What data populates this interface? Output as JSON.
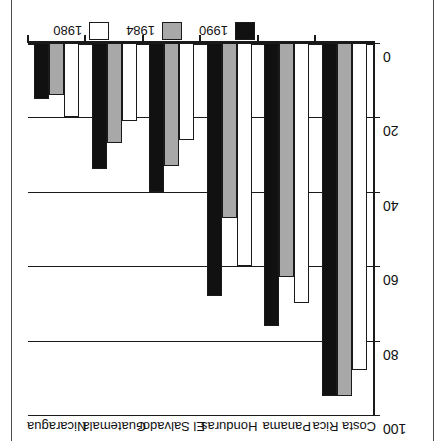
{
  "chart_data": {
    "type": "bar",
    "title": "",
    "subtitle": "",
    "xlabel": "",
    "ylabel": "",
    "ylim": [
      0,
      100
    ],
    "yticks": [
      0,
      20,
      40,
      60,
      80,
      100
    ],
    "ytick_labels": [
      "0",
      "20",
      "40",
      "60",
      "80",
      "100"
    ],
    "grid": true,
    "orientation": "vertical-inverted-180",
    "legend_position": "bottom-center",
    "categories": [
      "Costa Rica",
      "Panama",
      "Honduras",
      "El Salvador",
      "Guatemala",
      "Nicaragua"
    ],
    "series": [
      {
        "name": "1980",
        "color": "#ffffff",
        "values": [
          88,
          70,
          60,
          26,
          21,
          20
        ]
      },
      {
        "name": "1984",
        "color": "#a8a8a8",
        "values": [
          95,
          63,
          47,
          33,
          27,
          14
        ]
      },
      {
        "name": "1990",
        "color": "#111111",
        "values": [
          95,
          76,
          68,
          40,
          34,
          15
        ]
      }
    ]
  },
  "legend": {
    "entries": [
      {
        "label": "1990",
        "swatch": "y1990"
      },
      {
        "label": "1984",
        "swatch": "y1984"
      },
      {
        "label": "1980",
        "swatch": "y1980"
      }
    ]
  },
  "axis": {
    "tick_labels": [
      "0",
      "20",
      "40",
      "60",
      "80",
      "100"
    ]
  },
  "categories": {
    "labels": [
      "Costa Rica",
      "Panama",
      "Honduras",
      "El Salvador",
      "Guatemala",
      "Nicaragua"
    ]
  },
  "colors": {
    "y1980": "#ffffff",
    "y1984": "#a8a8a8",
    "y1990": "#111111",
    "axis": "#1a1a1a",
    "frame": "#4a4a4a"
  }
}
